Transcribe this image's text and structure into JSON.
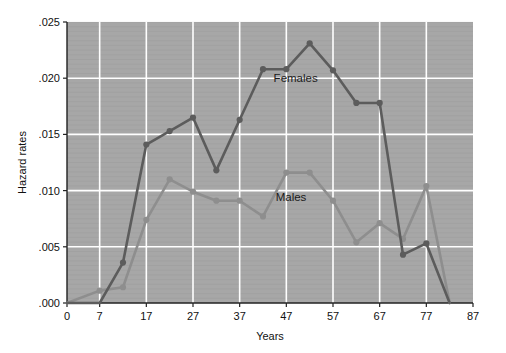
{
  "chart_data": {
    "type": "line",
    "title": "",
    "xlabel": "Years",
    "ylabel": "Hazard rates",
    "xlim": [
      0,
      87
    ],
    "ylim": [
      0.0,
      0.025
    ],
    "grid": true,
    "legend_position": "inline-annotation",
    "xticks": [
      0,
      7,
      17,
      27,
      37,
      47,
      57,
      67,
      77,
      87
    ],
    "xtick_labels": [
      "0",
      "7",
      "17",
      "27",
      "37",
      "47",
      "57",
      "67",
      "77",
      "87"
    ],
    "yticks": [
      0.0,
      0.005,
      0.01,
      0.015,
      0.02,
      0.025
    ],
    "ytick_labels": [
      ".000",
      ".005",
      ".010",
      ".015",
      ".020",
      ".025"
    ],
    "x": [
      0,
      7,
      12,
      17,
      22,
      27,
      32,
      37,
      42,
      47,
      52,
      57,
      62,
      67,
      72,
      77,
      82
    ],
    "series": [
      {
        "name": "Females",
        "color": "#5c5c5c",
        "marker": "circle",
        "values": [
          0.0,
          0.0,
          0.0036,
          0.0141,
          0.0153,
          0.0165,
          0.0118,
          0.0163,
          0.0208,
          0.0208,
          0.0231,
          0.0207,
          0.0178,
          0.0178,
          0.0043,
          0.0053,
          0.0
        ],
        "annotation": {
          "label": "Females",
          "x": 49,
          "y": 0.0197
        }
      },
      {
        "name": "Males",
        "color": "#8e8e8e",
        "marker": "circle",
        "values": [
          0.0,
          0.0011,
          0.0014,
          0.0074,
          0.011,
          0.0099,
          0.0091,
          0.0091,
          0.0077,
          0.0116,
          0.0116,
          0.0091,
          0.0054,
          0.0071,
          0.0057,
          0.0104,
          0.0
        ],
        "annotation": {
          "label": "Males",
          "x": 48,
          "y": 0.0091
        }
      }
    ],
    "plot_background": "#a7a7a7",
    "grid_color": "#ffffff",
    "axis_color": "#222222",
    "figure_background": "#ffffff"
  }
}
